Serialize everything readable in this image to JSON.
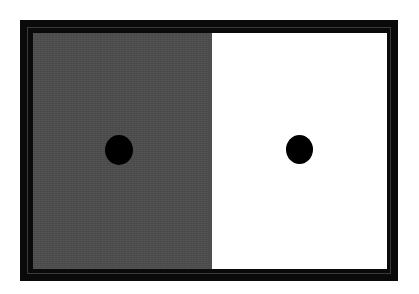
{
  "figure": {
    "frame_color": "#0a0a0a",
    "panels": [
      {
        "name": "left",
        "background": "#4d4d4d",
        "dot_color": "#000000"
      },
      {
        "name": "right",
        "background": "#ffffff",
        "dot_color": "#000000"
      }
    ]
  }
}
